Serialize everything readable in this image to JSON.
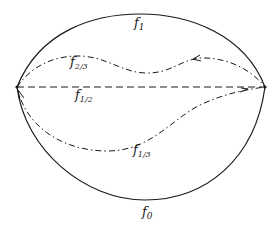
{
  "diagram": {
    "type": "homotopy-of-curves",
    "endpoints": {
      "left": {
        "x": 17,
        "y": 87
      },
      "right": {
        "x": 265,
        "y": 87
      }
    },
    "curves": [
      {
        "id": "f1",
        "label_base": "f",
        "label_sub": "1",
        "style": "solid",
        "position": "top arc"
      },
      {
        "id": "f2_3",
        "label_base": "f",
        "label_sub": "2/3",
        "style": "dash-dot",
        "position": "wavy upper curve"
      },
      {
        "id": "f1_2",
        "label_base": "f",
        "label_sub": "1/2",
        "style": "dashed",
        "position": "straight line between endpoints"
      },
      {
        "id": "f1_3",
        "label_base": "f",
        "label_sub": "1/3",
        "style": "dash-dot",
        "position": "lower inner curve"
      },
      {
        "id": "f0",
        "label_base": "f",
        "label_sub": "0",
        "style": "solid",
        "position": "bottom arc"
      }
    ],
    "colors": {
      "stroke": "#1a1a1a",
      "background": "#ffffff"
    }
  }
}
